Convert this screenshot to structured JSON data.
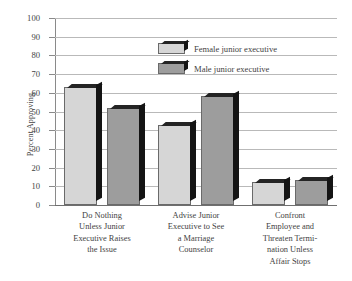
{
  "chart_data": {
    "type": "bar",
    "title": "",
    "subtitle": "",
    "xlabel": "",
    "ylabel": "Percent Approving",
    "ylim": [
      0,
      100
    ],
    "ytick_step": 10,
    "yticks": [
      0,
      10,
      20,
      30,
      40,
      50,
      60,
      70,
      80,
      90,
      100
    ],
    "ytick_labels": [
      "0",
      "10",
      "20",
      "30",
      "40",
      "50",
      "60",
      "70",
      "80",
      "90",
      "100"
    ],
    "grid": true,
    "grid_axis": "y",
    "legend_position": "upper-center",
    "categories": [
      "Do Nothing Unless Junior Executive Raises the Issue",
      "Advise Junior Executive to See a Marriage Counselor",
      "Confront Employee and Threaten Termination Unless Affair Stops"
    ],
    "category_lines": [
      [
        "Do Nothing",
        "Unless Junior",
        "Executive Raises",
        "the Issue"
      ],
      [
        "Advise Junior",
        "Executive to See",
        "a Marriage",
        "Counselor"
      ],
      [
        "Confront",
        "Employee and",
        "Threaten Termi-",
        "nation Unless",
        "Affair Stops"
      ]
    ],
    "series": [
      {
        "name": "Female junior executive",
        "color": "#d6d6d6",
        "values": [
          63,
          43,
          12.5
        ]
      },
      {
        "name": "Male junior executive",
        "color": "#9d9d9d",
        "values": [
          52,
          58.5,
          13.5
        ]
      }
    ]
  },
  "legend": {
    "items": [
      {
        "label": "Female junior executive",
        "swatch": "female"
      },
      {
        "label": "Male junior executive",
        "swatch": "male"
      }
    ]
  }
}
